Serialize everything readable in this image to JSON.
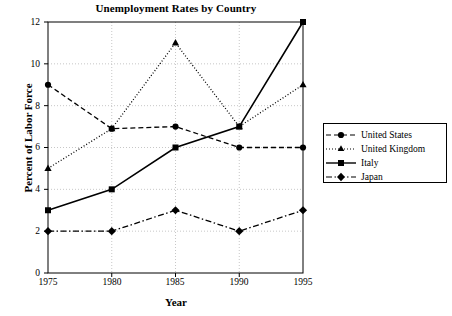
{
  "chart_data": {
    "type": "line",
    "title": "Unemployment Rates by Country",
    "xlabel": "Year",
    "ylabel": "Percent of  Labor Force",
    "x": [
      1975,
      1980,
      1985,
      1990,
      1995
    ],
    "xticklabels": [
      "1975",
      "1980",
      "1985",
      "1990",
      "1995"
    ],
    "yticklabels": [
      "0",
      "2",
      "4",
      "6",
      "8",
      "10",
      "12"
    ],
    "yticks": [
      0,
      2,
      4,
      6,
      8,
      10,
      12
    ],
    "xlim": [
      1975,
      1995
    ],
    "ylim": [
      0,
      12
    ],
    "grid": true,
    "legend_position": "right-outside",
    "series": [
      {
        "name": "United States",
        "values": [
          9,
          6.9,
          7,
          6,
          6
        ],
        "marker": "circle",
        "linestyle": "dashed",
        "color": "#000000"
      },
      {
        "name": "United Kingdom",
        "values": [
          5,
          6.9,
          11,
          7,
          9
        ],
        "marker": "triangle",
        "linestyle": "dotted",
        "color": "#000000"
      },
      {
        "name": "Italy",
        "values": [
          3,
          4,
          6,
          7,
          12
        ],
        "marker": "square",
        "linestyle": "solid",
        "color": "#000000"
      },
      {
        "name": "Japan",
        "values": [
          2,
          2,
          3,
          2,
          3
        ],
        "marker": "diamond",
        "linestyle": "dashdot",
        "color": "#000000"
      }
    ]
  },
  "legend": {
    "items": [
      {
        "label": "United States"
      },
      {
        "label": "United Kingdom"
      },
      {
        "label": "Italy"
      },
      {
        "label": "Japan"
      }
    ]
  },
  "colors": {
    "axis": "#000000",
    "grid": "#b9b9b9",
    "background": "#ffffff"
  }
}
